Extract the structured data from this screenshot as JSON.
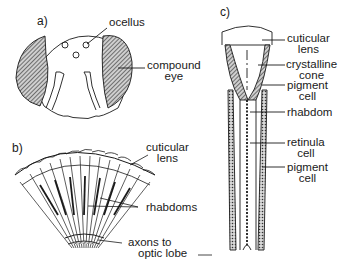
{
  "diagram": {
    "panels": [
      {
        "tag": "a)",
        "subject": "insect head, frontal view",
        "labels": {
          "ocellus": "ocellus",
          "compound_eye_1": "compound",
          "compound_eye_2": "eye"
        }
      },
      {
        "tag": "b)",
        "subject": "compound eye section",
        "labels": {
          "cuticular_lens_1": "cuticular",
          "cuticular_lens_2": "lens",
          "rhabdoms": "rhabdoms",
          "axons_1": "axons to",
          "axons_2": "optic lobe"
        }
      },
      {
        "tag": "c)",
        "subject": "single ommatidium",
        "labels": {
          "cuticular_lens_1": "cuticular",
          "cuticular_lens_2": "lens",
          "crystalline_cone_1": "crystalline",
          "crystalline_cone_2": "cone",
          "pigment_cell_1": "pigment",
          "pigment_cell_2": "cell",
          "rhabdom": "rhabdom",
          "retinula_cell_1": "retinula",
          "retinula_cell_2": "cell",
          "pigment_cell_lower_1": "pigment",
          "pigment_cell_lower_2": "cell"
        }
      }
    ],
    "colors": {
      "line": "#1a1a1a",
      "hatch": "#555555",
      "background": "#ffffff"
    }
  }
}
